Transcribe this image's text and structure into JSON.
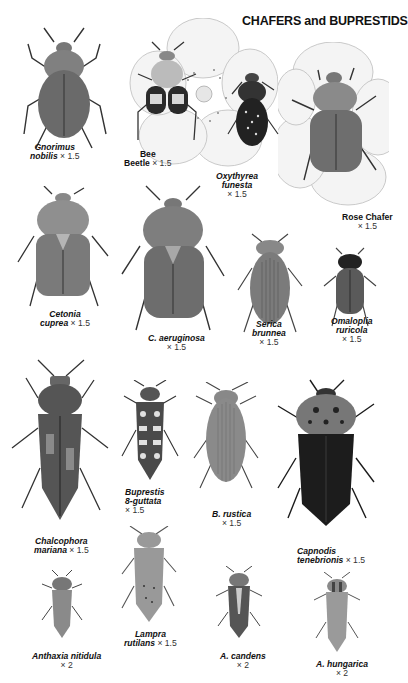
{
  "plate": {
    "title": "CHAFERS and BUPRESTIDS",
    "background": "#ffffff"
  },
  "specimens": [
    {
      "id": "gnorimus",
      "name_line1": "Gnorimus",
      "name_line2": "nobilis",
      "magnification": "× 1.5",
      "italic": true,
      "tone": "#6a6a6a"
    },
    {
      "id": "bee-beetle",
      "name_line1": "Bee",
      "name_line2": "Beetle",
      "magnification": "× 1.5",
      "italic": false,
      "tone": "#3a3a3a"
    },
    {
      "id": "oxythyrea",
      "name_line1": "Oxythyrea",
      "name_line2": "funesta",
      "magnification": "× 1.5",
      "italic": true,
      "tone": "#2a2a2a"
    },
    {
      "id": "rose-chafer",
      "name_line1": "Rose Chafer",
      "name_line2": "",
      "magnification": "× 1.5",
      "italic": false,
      "tone": "#6e6e6e"
    },
    {
      "id": "cetonia",
      "name_line1": "Cetonia",
      "name_line2": "cuprea",
      "magnification": "× 1.5",
      "italic": true,
      "tone": "#7a7a7a"
    },
    {
      "id": "c-aeruginosa",
      "name_line1": "C. aeruginosa",
      "name_line2": "",
      "magnification": "× 1.5",
      "italic": true,
      "tone": "#6d6d6d"
    },
    {
      "id": "serica",
      "name_line1": "Serica",
      "name_line2": "brunnea",
      "magnification": "× 1.5",
      "italic": true,
      "tone": "#7b7b7b"
    },
    {
      "id": "omaloplia",
      "name_line1": "Omaloplia",
      "name_line2": "ruricola",
      "magnification": "× 1.5",
      "italic": true,
      "tone": "#5a5a5a"
    },
    {
      "id": "chalcophora",
      "name_line1": "Chalcophora",
      "name_line2": "mariana",
      "magnification": "× 1.5",
      "italic": true,
      "tone": "#555555"
    },
    {
      "id": "buprestis",
      "name_line1": "Buprestis",
      "name_line2": "8-guttata",
      "magnification": "× 1.5",
      "italic": true,
      "tone": "#4a4a4a"
    },
    {
      "id": "b-rustica",
      "name_line1": "B. rustica",
      "name_line2": "",
      "magnification": "× 1.5",
      "italic": true,
      "tone": "#8a8a8a"
    },
    {
      "id": "capnodis",
      "name_line1": "Capnodis",
      "name_line2": "tenebrionis",
      "magnification": "× 1.5",
      "italic": true,
      "tone": "#1c1c1c"
    },
    {
      "id": "anthaxia",
      "name_line1": "Anthaxia nitidula",
      "name_line2": "",
      "magnification": "× 2",
      "italic": true,
      "tone": "#8a8a8a"
    },
    {
      "id": "lampra",
      "name_line1": "Lampra",
      "name_line2": "rutilans",
      "magnification": "× 1.5",
      "italic": true,
      "tone": "#999999"
    },
    {
      "id": "a-candens",
      "name_line1": "A. candens",
      "name_line2": "",
      "magnification": "× 2",
      "italic": true,
      "tone": "#555555"
    },
    {
      "id": "a-hungarica",
      "name_line1": "A. hungarica",
      "name_line2": "",
      "magnification": "× 2",
      "italic": true,
      "tone": "#9a9a9a"
    }
  ]
}
